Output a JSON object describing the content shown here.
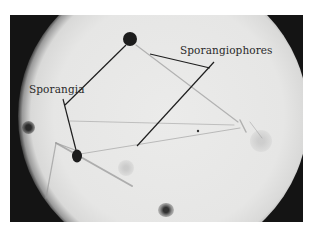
{
  "figure": {
    "type": "micrograph",
    "labels": {
      "sporangia": "Sporangia",
      "sporangiophores": "Sporangiophores"
    },
    "colors": {
      "background": "#ffffff",
      "vignette": "#141414",
      "field": "#e8e8e7",
      "sporangium": "#1c1c1c",
      "leader_line": "#1e1e1e"
    }
  }
}
